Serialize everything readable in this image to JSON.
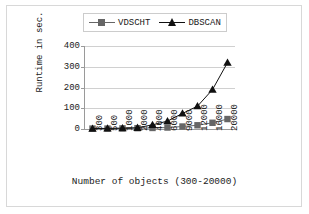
{
  "chart_data": {
    "type": "line",
    "title": "",
    "xlabel": "Number of objects (300-20000)",
    "ylabel": "Runtime in sec.",
    "categories": [
      "300",
      "500",
      "1000",
      "2000",
      "4000",
      "6000",
      "9000",
      "12000",
      "16000",
      "20000"
    ],
    "yticks": [
      "0",
      "100",
      "200",
      "300",
      "400"
    ],
    "ylim": [
      0,
      400
    ],
    "grid": true,
    "legend_position": "top-center",
    "series": [
      {
        "name": "VDSCHT",
        "marker": "square",
        "color": "#666666",
        "values": [
          2,
          2,
          3,
          4,
          5,
          7,
          12,
          18,
          30,
          48
        ]
      },
      {
        "name": "DBSCAN",
        "marker": "triangle",
        "color": "#111111",
        "values": [
          2,
          3,
          4,
          6,
          20,
          38,
          75,
          110,
          190,
          320
        ]
      }
    ]
  },
  "legend": {
    "items": [
      {
        "label": "VDSCHT",
        "marker": "square-marker"
      },
      {
        "label": "DBSCAN",
        "marker": "triangle-marker"
      }
    ]
  },
  "axes": {
    "y_title": "Runtime in sec.",
    "x_title": "Number of objects (300-20000)"
  }
}
